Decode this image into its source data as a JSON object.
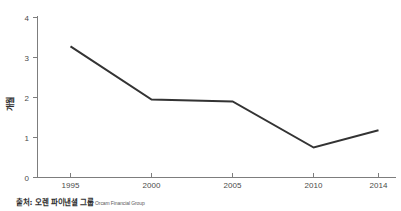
{
  "caption": {
    "korean": "출처: 오렌 파이낸셜 그룹",
    "english": "Orcam Financial Group"
  },
  "axis": {
    "y_label": "개월",
    "y_ticks": [
      "0",
      "1",
      "2",
      "3",
      "4"
    ],
    "x_ticks": [
      "1995",
      "2000",
      "2005",
      "2010",
      "2014"
    ]
  },
  "style": {
    "line_color": "#333333",
    "axis_color": "#7d7d7d",
    "background": "#ffffff"
  },
  "chart_data": {
    "type": "line",
    "title": "",
    "subtitle": "",
    "xlabel": "",
    "ylabel": "개월",
    "categories": [
      "1995",
      "2000",
      "2005",
      "2010",
      "2014"
    ],
    "x": [
      1995,
      2000,
      2005,
      2010,
      2014
    ],
    "values": [
      3.28,
      1.95,
      1.9,
      0.75,
      1.18
    ],
    "series": [
      {
        "name": "개월",
        "values": [
          3.28,
          1.95,
          1.9,
          0.75,
          1.18
        ],
        "color": "#333333"
      }
    ],
    "ylim": [
      0,
      4
    ],
    "xlim": [
      1995,
      2014
    ],
    "y_ticks": [
      0,
      1,
      2,
      3,
      4
    ],
    "x_ticks": [
      1995,
      2000,
      2005,
      2010,
      2014
    ],
    "grid": false,
    "legend": false,
    "legend_position": "none",
    "annotations": [
      "출처: 오렌 파이낸셜 그룹 Orcam Financial Group"
    ]
  }
}
